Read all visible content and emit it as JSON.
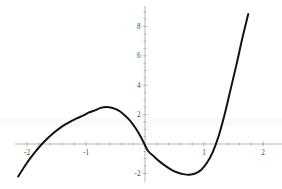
{
  "chart_data": {
    "type": "line",
    "title": "",
    "subtitle": "",
    "xlabel": "",
    "ylabel": "",
    "xlim": [
      -2.2,
      2.2
    ],
    "ylim": [
      -2.6,
      9.4
    ],
    "grid": false,
    "legend": null,
    "axis_style": "crossed-at-origin",
    "curve_color": "#131313",
    "axis_color": "#9a9a9a",
    "background_color": "#ffffff",
    "x_ticks_major": [
      -2,
      -1,
      1,
      2
    ],
    "x_tick_labels": [
      "-2",
      "-1",
      "1",
      "2"
    ],
    "x_ticks_minor": [
      -1.8,
      -1.6,
      -1.4,
      -1.2,
      -0.8,
      -0.6,
      -0.4,
      -0.2,
      0.2,
      0.4,
      0.6,
      0.8,
      1.2,
      1.4,
      1.6,
      1.8,
      2.0
    ],
    "y_ticks_major": [
      -2,
      2,
      4,
      6,
      8
    ],
    "y_tick_labels": [
      "-2",
      "2",
      "4",
      "6",
      "8"
    ],
    "y_ticks_minor": [
      -1.5,
      -1,
      -0.5,
      0.5,
      1,
      1.5,
      2.5,
      3,
      3.5,
      4.5,
      5,
      5.5,
      6.5,
      7,
      7.5,
      8.5,
      9
    ],
    "series": [
      {
        "name": "f(x)",
        "x": [
          -2.15,
          -2.05,
          -1.95,
          -1.85,
          -1.75,
          -1.65,
          -1.55,
          -1.45,
          -1.35,
          -1.25,
          -1.15,
          -1.05,
          -0.95,
          -0.85,
          -0.75,
          -0.65,
          -0.55,
          -0.45,
          -0.35,
          -0.25,
          -0.15,
          -0.05,
          0.05,
          0.15,
          0.25,
          0.35,
          0.45,
          0.55,
          0.65,
          0.75,
          0.85,
          0.95,
          1.05,
          1.15,
          1.25,
          1.35,
          1.45,
          1.55,
          1.65,
          1.75
        ],
        "y": [
          -2.21,
          -1.58,
          -1.0,
          -0.48,
          -0.02,
          0.39,
          0.75,
          1.06,
          1.33,
          1.56,
          1.76,
          1.93,
          2.15,
          2.29,
          2.46,
          2.52,
          2.45,
          2.28,
          1.98,
          1.58,
          1.02,
          0.33,
          -0.46,
          -0.84,
          -1.2,
          -1.5,
          -1.76,
          -1.94,
          -2.05,
          -2.09,
          -2.01,
          -1.77,
          -1.28,
          -0.53,
          0.56,
          2.02,
          3.7,
          5.4,
          7.2,
          8.85
        ]
      }
    ],
    "features": {
      "local_maximum": {
        "x": -0.72,
        "y": 2.6
      },
      "local_minimum": {
        "x": 0.78,
        "y": -2.1
      },
      "roots": [
        -1.74,
        0.1,
        1.29
      ],
      "left_endpoint": {
        "x": -2.15,
        "y": -2.21
      },
      "right_endpoint": {
        "x": 1.75,
        "y": 8.85
      }
    }
  }
}
